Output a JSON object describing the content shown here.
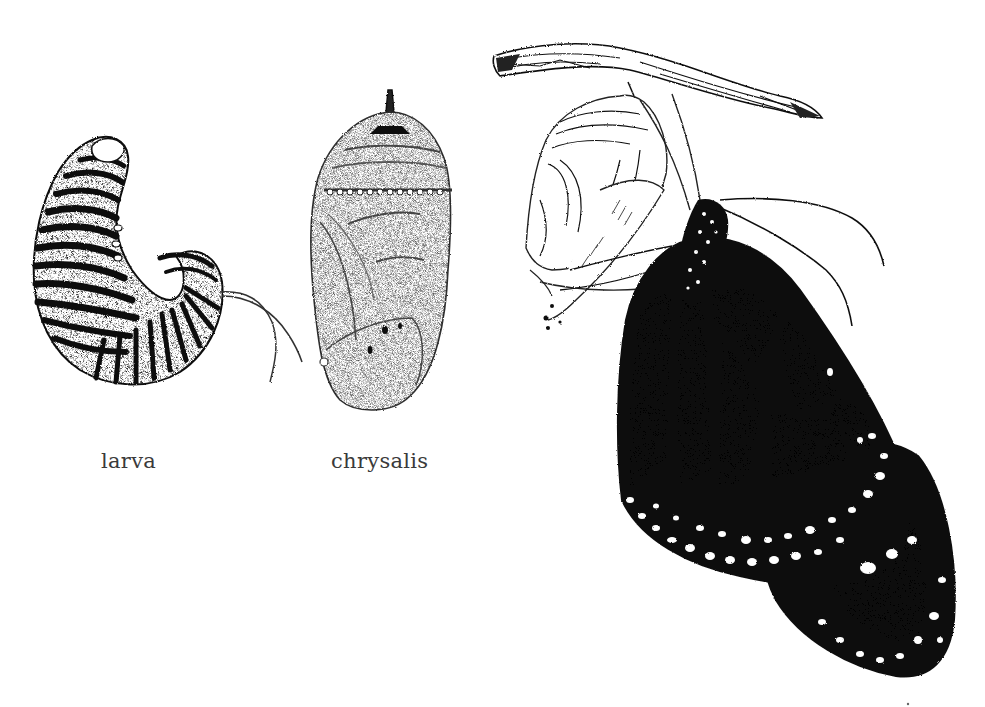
{
  "illustration": {
    "subject": "Monarch butterfly life cycle",
    "style": "pen-and-ink stipple drawing",
    "background_color": "#ffffff",
    "ink_color": "#111111",
    "stages": [
      {
        "id": "larva",
        "label": "larva"
      },
      {
        "id": "chrysalis",
        "label": "chrysalis"
      },
      {
        "id": "adult",
        "label": ""
      }
    ]
  },
  "labels": {
    "larva": "larva",
    "chrysalis": "chrysalis"
  }
}
